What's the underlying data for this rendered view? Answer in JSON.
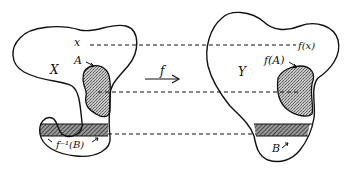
{
  "diagram": {
    "colors": {
      "stroke": "#111111",
      "background": "#ffffff",
      "stipple": "#9a9a9a",
      "hatch": "#333333"
    },
    "domain_set": {
      "label": "X",
      "point_label": "x",
      "subset_label": "A",
      "preimage_label": "f⁻¹(B)"
    },
    "codomain_set": {
      "label": "Y",
      "point_label": "f(x)",
      "image_label": "f(A)",
      "subset_label": "B"
    },
    "map": {
      "label": "f",
      "direction": "right"
    },
    "connectors": [
      {
        "from": "x",
        "to": "f(x)",
        "style": "dashed"
      },
      {
        "from": "A",
        "to": "f(A)",
        "style": "dashed"
      },
      {
        "from": "f⁻¹(B)",
        "to": "B",
        "style": "dashed"
      }
    ]
  }
}
